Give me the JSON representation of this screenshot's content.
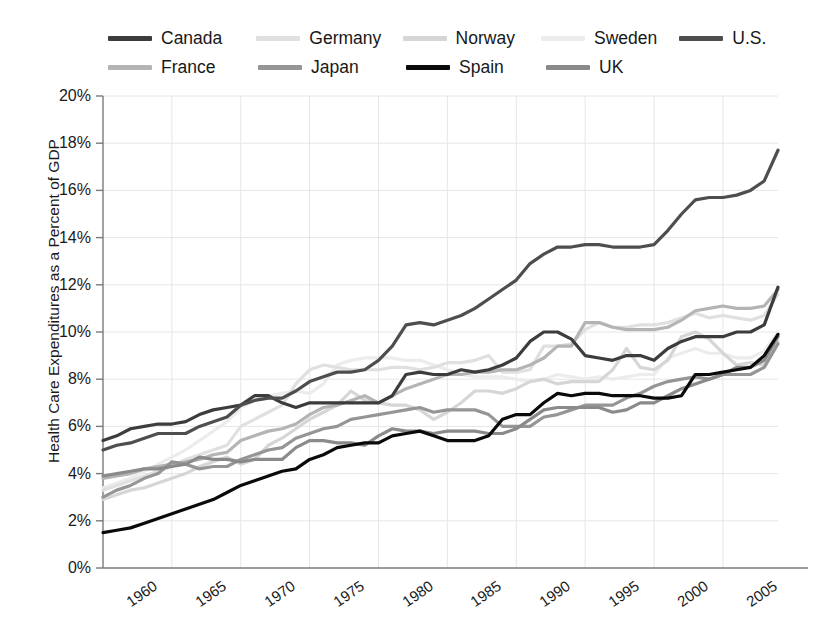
{
  "chart_data": {
    "type": "line",
    "title": "",
    "xlabel": "",
    "ylabel": "Health Care Expenditures as a Percent of GDP",
    "xlim": [
      1960,
      2009
    ],
    "ylim": [
      0,
      20
    ],
    "ytick_labels": [
      "0%",
      "2%",
      "4%",
      "6%",
      "8%",
      "10%",
      "12%",
      "14%",
      "16%",
      "18%",
      "20%"
    ],
    "ytick_values": [
      0,
      2,
      4,
      6,
      8,
      10,
      12,
      14,
      16,
      18,
      20
    ],
    "xtick_labels": [
      "1960",
      "1965",
      "1970",
      "1975",
      "1980",
      "1985",
      "1990",
      "1995",
      "2000",
      "2005"
    ],
    "xtick_values": [
      1960,
      1965,
      1970,
      1975,
      1980,
      1985,
      1990,
      1995,
      2000,
      2005
    ],
    "grid": true,
    "legend_position": "top",
    "x": [
      1960,
      1961,
      1962,
      1963,
      1964,
      1965,
      1966,
      1967,
      1968,
      1969,
      1970,
      1971,
      1972,
      1973,
      1974,
      1975,
      1976,
      1977,
      1978,
      1979,
      1980,
      1981,
      1982,
      1983,
      1984,
      1985,
      1986,
      1987,
      1988,
      1989,
      1990,
      1991,
      1992,
      1993,
      1994,
      1995,
      1996,
      1997,
      1998,
      1999,
      2000,
      2001,
      2002,
      2003,
      2004,
      2005,
      2006,
      2007,
      2008,
      2009
    ],
    "series": [
      {
        "name": "Canada",
        "color": "#3c3c3c",
        "values": [
          5.4,
          5.6,
          5.9,
          6.0,
          6.1,
          6.1,
          6.2,
          6.5,
          6.7,
          6.8,
          6.9,
          7.3,
          7.3,
          7.0,
          6.8,
          7.0,
          7.0,
          7.0,
          7.0,
          7.0,
          7.0,
          7.3,
          8.2,
          8.3,
          8.2,
          8.2,
          8.4,
          8.3,
          8.4,
          8.6,
          8.9,
          9.6,
          10.0,
          10.0,
          9.7,
          9.0,
          8.9,
          8.8,
          9.0,
          9.0,
          8.8,
          9.3,
          9.6,
          9.8,
          9.8,
          9.8,
          10.0,
          10.0,
          10.3,
          11.9
        ]
      },
      {
        "name": "France",
        "color": "#b4b4b4",
        "values": [
          3.8,
          3.9,
          4.0,
          4.2,
          4.3,
          4.4,
          4.5,
          4.6,
          4.8,
          4.9,
          5.4,
          5.6,
          5.8,
          5.9,
          6.1,
          6.5,
          6.8,
          6.9,
          7.1,
          7.3,
          7.0,
          7.3,
          7.6,
          7.8,
          8.0,
          8.2,
          8.2,
          8.3,
          8.3,
          8.4,
          8.4,
          8.6,
          8.9,
          9.4,
          9.4,
          10.4,
          10.4,
          10.2,
          10.1,
          10.1,
          10.1,
          10.2,
          10.5,
          10.9,
          11.0,
          11.1,
          11.0,
          11.0,
          11.1,
          11.8
        ]
      },
      {
        "name": "Germany",
        "color": "#e0e0e0",
        "values": [
          3.3,
          3.5,
          3.7,
          3.9,
          4.1,
          4.3,
          4.6,
          4.8,
          5.0,
          5.2,
          6.0,
          6.3,
          6.6,
          6.9,
          7.8,
          8.4,
          8.6,
          8.5,
          8.4,
          8.4,
          8.4,
          8.5,
          8.5,
          8.4,
          8.5,
          8.7,
          8.7,
          8.8,
          9.0,
          8.3,
          8.3,
          8.4,
          9.4,
          9.4,
          9.5,
          10.1,
          10.4,
          10.2,
          10.2,
          10.3,
          10.3,
          10.4,
          10.6,
          10.8,
          10.6,
          10.7,
          10.6,
          10.5,
          10.7,
          11.6
        ]
      },
      {
        "name": "Japan",
        "color": "#959595",
        "values": [
          3.0,
          3.3,
          3.5,
          3.8,
          4.0,
          4.5,
          4.4,
          4.2,
          4.3,
          4.3,
          4.6,
          4.8,
          5.0,
          5.1,
          5.5,
          5.7,
          5.9,
          6.0,
          6.3,
          6.4,
          6.5,
          6.6,
          6.7,
          6.8,
          6.6,
          6.7,
          6.7,
          6.7,
          6.5,
          6.0,
          6.0,
          6.0,
          6.4,
          6.5,
          6.7,
          6.9,
          6.9,
          6.9,
          7.2,
          7.4,
          7.7,
          7.9,
          8.0,
          8.1,
          8.0,
          8.2,
          8.2,
          8.2,
          8.5,
          9.5
        ]
      },
      {
        "name": "Norway",
        "color": "#d6d6d6",
        "values": [
          2.9,
          3.1,
          3.3,
          3.4,
          3.6,
          3.8,
          4.0,
          4.3,
          4.5,
          4.7,
          4.4,
          4.6,
          5.2,
          5.5,
          5.9,
          6.3,
          6.6,
          6.9,
          7.5,
          7.1,
          7.0,
          6.9,
          6.9,
          6.7,
          6.3,
          6.6,
          7.0,
          7.5,
          7.5,
          7.4,
          7.6,
          7.9,
          8.0,
          7.8,
          7.9,
          7.9,
          7.9,
          8.4,
          9.3,
          8.5,
          8.4,
          8.8,
          9.8,
          10.0,
          9.7,
          9.1,
          8.6,
          8.7,
          8.6,
          9.6
        ]
      },
      {
        "name": "Spain",
        "color": "#0a0a0a",
        "values": [
          1.5,
          1.6,
          1.7,
          1.9,
          2.1,
          2.3,
          2.5,
          2.7,
          2.9,
          3.2,
          3.5,
          3.7,
          3.9,
          4.1,
          4.2,
          4.6,
          4.8,
          5.1,
          5.2,
          5.3,
          5.3,
          5.6,
          5.7,
          5.8,
          5.6,
          5.4,
          5.4,
          5.4,
          5.6,
          6.3,
          6.5,
          6.5,
          7.0,
          7.4,
          7.3,
          7.4,
          7.4,
          7.3,
          7.3,
          7.3,
          7.2,
          7.2,
          7.3,
          8.2,
          8.2,
          8.3,
          8.4,
          8.5,
          9.0,
          9.9
        ]
      },
      {
        "name": "Sweden",
        "color": "#ececec",
        "values": [
          3.4,
          3.6,
          3.8,
          4.1,
          4.4,
          4.7,
          5.0,
          5.4,
          5.8,
          6.2,
          6.8,
          7.1,
          7.3,
          7.4,
          7.5,
          7.4,
          7.8,
          8.6,
          8.8,
          8.9,
          8.9,
          8.9,
          8.8,
          8.8,
          8.6,
          8.4,
          8.2,
          8.1,
          8.1,
          8.1,
          8.0,
          7.9,
          8.0,
          8.2,
          8.1,
          8.0,
          8.1,
          8.0,
          8.1,
          8.2,
          8.2,
          8.9,
          9.1,
          9.3,
          9.1,
          9.1,
          8.9,
          8.9,
          9.2,
          10.0
        ]
      },
      {
        "name": "U.S.",
        "color": "#4e4e4e",
        "values": [
          5.0,
          5.2,
          5.3,
          5.5,
          5.7,
          5.7,
          5.7,
          6.0,
          6.2,
          6.4,
          6.9,
          7.1,
          7.2,
          7.2,
          7.5,
          7.9,
          8.1,
          8.3,
          8.3,
          8.4,
          8.8,
          9.4,
          10.3,
          10.4,
          10.3,
          10.5,
          10.7,
          11.0,
          11.4,
          11.8,
          12.2,
          12.9,
          13.3,
          13.6,
          13.6,
          13.7,
          13.7,
          13.6,
          13.6,
          13.6,
          13.7,
          14.3,
          15.0,
          15.6,
          15.7,
          15.7,
          15.8,
          16.0,
          16.4,
          17.7
        ]
      },
      {
        "name": "UK",
        "color": "#8a8a8a",
        "values": [
          3.9,
          4.0,
          4.1,
          4.2,
          4.2,
          4.3,
          4.4,
          4.7,
          4.6,
          4.6,
          4.5,
          4.6,
          4.6,
          4.6,
          5.1,
          5.4,
          5.4,
          5.3,
          5.3,
          5.2,
          5.6,
          5.9,
          5.8,
          5.8,
          5.7,
          5.8,
          5.8,
          5.8,
          5.7,
          5.7,
          5.9,
          6.3,
          6.7,
          6.8,
          6.8,
          6.8,
          6.8,
          6.6,
          6.7,
          7.0,
          7.0,
          7.3,
          7.6,
          7.8,
          8.0,
          8.2,
          8.5,
          8.5,
          8.8,
          9.8
        ]
      }
    ],
    "legend": [
      {
        "name": "Canada",
        "color": "#3c3c3c"
      },
      {
        "name": "Germany",
        "color": "#e0e0e0"
      },
      {
        "name": "Norway",
        "color": "#d6d6d6"
      },
      {
        "name": "Sweden",
        "color": "#ececec"
      },
      {
        "name": "U.S.",
        "color": "#4e4e4e"
      },
      {
        "name": "France",
        "color": "#b4b4b4"
      },
      {
        "name": "Japan",
        "color": "#959595"
      },
      {
        "name": "Spain",
        "color": "#0a0a0a"
      },
      {
        "name": "UK",
        "color": "#8a8a8a"
      }
    ],
    "legend_rows": [
      [
        "Canada",
        "Germany",
        "Norway",
        "Sweden",
        "U.S."
      ],
      [
        "France",
        "Japan",
        "Spain",
        "UK"
      ]
    ],
    "style": {
      "background": "#ffffff",
      "axis_color": "#7a7a7a",
      "grid_color": "#e6e6e6",
      "text_color": "#1a1a1a",
      "line_width": 3.2
    }
  }
}
